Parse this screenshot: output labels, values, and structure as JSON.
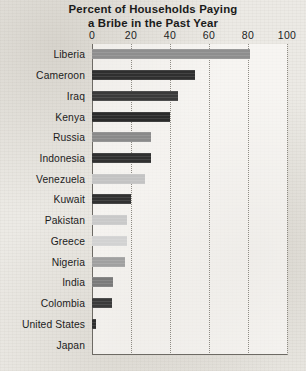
{
  "title": {
    "line1": "Percent of Households Paying",
    "line2": "a Bribe in the Past Year"
  },
  "axis": {
    "ticks": [
      "0",
      "20",
      "40",
      "60",
      "80",
      "100"
    ]
  },
  "chart_data": {
    "type": "bar",
    "orientation": "horizontal",
    "title": "Percent of Households Paying a Bribe in the Past Year",
    "xlabel": "",
    "ylabel": "",
    "xlim": [
      0,
      100
    ],
    "xticks": [
      0,
      20,
      40,
      60,
      80,
      100
    ],
    "grid": true,
    "legend": false,
    "categories": [
      "Liberia",
      "Cameroon",
      "Iraq",
      "Kenya",
      "Russia",
      "Indonesia",
      "Venezuela",
      "Kuwait",
      "Pakistan",
      "Greece",
      "Nigeria",
      "India",
      "Colombia",
      "United States",
      "Japan"
    ],
    "values": [
      81,
      53,
      44,
      40,
      30,
      30,
      27,
      20,
      18,
      18,
      17,
      11,
      10,
      2,
      0
    ],
    "bar_colors": [
      "#8e8e8e",
      "#2f2f2f",
      "#3a3a3a",
      "#2b2b2b",
      "#8a8a8a",
      "#303030",
      "#c3c3c3",
      "#313131",
      "#c9c9c9",
      "#d2d2d2",
      "#a0a0a0",
      "#7a7a7a",
      "#3a3a3a",
      "#2e2e2e",
      "#2e2e2e"
    ]
  }
}
